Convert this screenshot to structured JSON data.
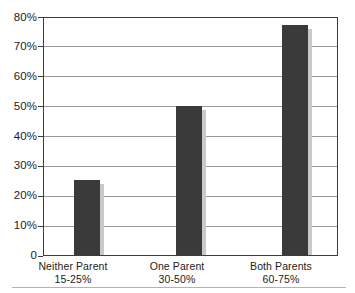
{
  "chart_data": {
    "type": "bar",
    "title": "",
    "title_note": "cropped/illegible at top edge",
    "xlabel": "",
    "ylabel": "",
    "categories": [
      "Neither Parent",
      "One Parent",
      "Both Parents"
    ],
    "category_sublabels": [
      "15-25%",
      "30-50%",
      "60-75%"
    ],
    "values": [
      25,
      50,
      77
    ],
    "ylim": [
      0,
      80
    ],
    "y_tick_values": [
      0,
      10,
      20,
      30,
      40,
      50,
      60,
      70,
      80
    ],
    "y_tick_labels": [
      "0",
      "10%",
      "20%",
      "30%",
      "40%",
      "50%",
      "60%",
      "70%",
      "80%"
    ],
    "grid": true,
    "legend": "none",
    "bar_color": "#3a3a3a",
    "gridline_color": "#9a9a9a",
    "frame_color": "#3d3d3d",
    "shadow_color": "#c9c9c9"
  },
  "axis": {
    "y_labels": [
      "80%",
      "70%",
      "60%",
      "50%",
      "40%",
      "30%",
      "20%",
      "10%",
      "0"
    ],
    "x_categories": [
      {
        "name": "Neither Parent",
        "range": "15-25%"
      },
      {
        "name": "One Parent",
        "range": "30-50%"
      },
      {
        "name": "Both Parents",
        "range": "60-75%"
      }
    ]
  }
}
